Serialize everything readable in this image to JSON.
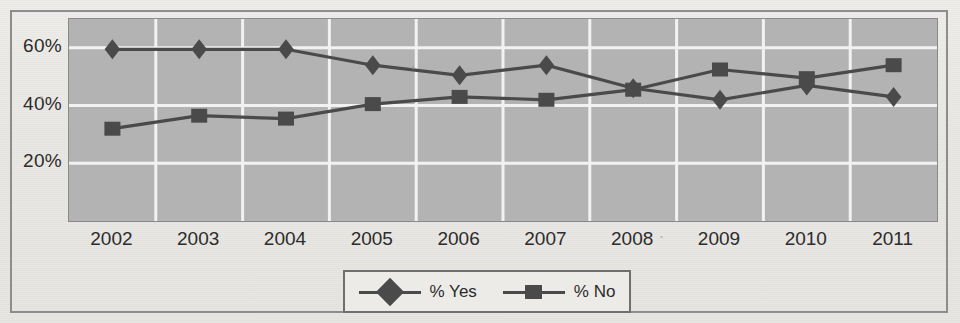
{
  "chart_data": {
    "type": "line",
    "title": "",
    "xlabel": "",
    "ylabel": "",
    "categories": [
      "2002",
      "2003",
      "2004",
      "2005",
      "2006",
      "2007",
      "2008",
      "2009",
      "2010",
      "2011"
    ],
    "ylim": [
      0,
      70
    ],
    "yticks": [
      20,
      40,
      60
    ],
    "ytick_labels": [
      "20%",
      "40%",
      "60%"
    ],
    "grid": true,
    "legend_position": "bottom",
    "series": [
      {
        "name": "% Yes",
        "marker": "diamond",
        "color": "#4a4a4a",
        "values": [
          59.5,
          59.5,
          59.5,
          54,
          50.5,
          54,
          46,
          42,
          47,
          43
        ]
      },
      {
        "name": "% No",
        "marker": "square",
        "color": "#4a4a4a",
        "values": [
          32,
          36.5,
          35.5,
          40.5,
          43,
          42,
          45.5,
          52.5,
          49.5,
          54
        ]
      }
    ]
  },
  "axes": {
    "y_ticks": [
      "60%",
      "40%",
      "20%"
    ],
    "x_ticks": [
      "2002",
      "2003",
      "2004",
      "2005",
      "2006",
      "2007",
      "2008",
      "2009",
      "2010",
      "2011"
    ]
  },
  "legend": {
    "items": [
      {
        "label": "% Yes",
        "marker": "diamond-marker"
      },
      {
        "label": "% No",
        "marker": "square-marker"
      }
    ]
  }
}
